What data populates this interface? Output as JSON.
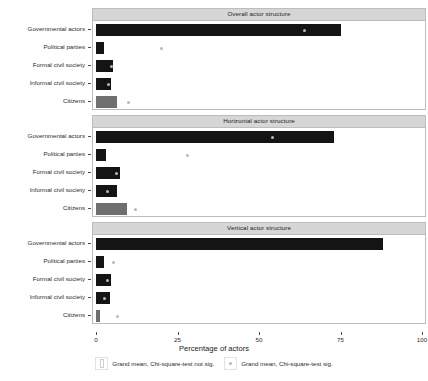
{
  "chart_data": {
    "type": "bar",
    "title": "",
    "xlabel": "Percentage of actors",
    "ylabel": "",
    "xlim": [
      0,
      100
    ],
    "xticks": [
      0,
      25,
      50,
      75,
      100
    ],
    "xticklabels": [
      "0",
      "25",
      "50",
      "75",
      "100"
    ],
    "grid": false,
    "orientation": "horizontal",
    "categories": [
      "Governmental actors",
      "Political parties",
      "Formal civil society",
      "Informal civil society",
      "Citizens"
    ],
    "panels": [
      {
        "title": "Overall actor structure",
        "values": [
          75.0,
          2.6,
          5.2,
          4.5,
          6.5
        ],
        "bar_colors": [
          "#141414",
          "#141414",
          "#141414",
          "#141414",
          "#6f6f6f"
        ],
        "grand_means": [
          64.0,
          20.0,
          4.8,
          3.9,
          10.0
        ],
        "grand_mean_significant": [
          true,
          true,
          true,
          true,
          true
        ]
      },
      {
        "title": "Horizontal actor structure",
        "values": [
          73.0,
          3.0,
          7.5,
          6.5,
          9.5
        ],
        "bar_colors": [
          "#141414",
          "#141414",
          "#141414",
          "#141414",
          "#6f6f6f"
        ],
        "grand_means": [
          54.0,
          28.0,
          6.2,
          3.6,
          12.0
        ],
        "grand_mean_significant": [
          true,
          true,
          true,
          true,
          true
        ]
      },
      {
        "title": "Vertical actor structure",
        "values": [
          88.0,
          2.6,
          4.5,
          4.2,
          1.2
        ],
        "bar_colors": [
          "#141414",
          "#141414",
          "#141414",
          "#141414",
          "#6f6f6f"
        ],
        "grand_means": [
          null,
          5.5,
          3.6,
          2.6,
          6.5
        ],
        "grand_mean_significant": [
          false,
          true,
          true,
          true,
          true
        ]
      }
    ],
    "legend": {
      "position": "bottom",
      "entries": [
        {
          "label": "Grand mean, Chi-square-test not sig.",
          "glyph": "bar-outline"
        },
        {
          "label": "Grand mean, Chi-square-test sig.",
          "glyph": "dot"
        }
      ]
    },
    "colors": {
      "bar_dark": "#141414",
      "bar_light": "#6f6f6f",
      "marker": "#b9b9b9",
      "panel_strip": "#d6d6d6",
      "panel_border": "#bdbdbd"
    }
  }
}
